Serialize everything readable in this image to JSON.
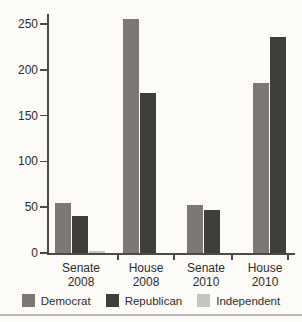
{
  "chart_data": {
    "type": "bar",
    "categories": [
      "Senate 2008",
      "House 2008",
      "Senate 2010",
      "House 2010"
    ],
    "series": [
      {
        "name": "Democrat",
        "color": "#7b7875",
        "values": [
          55,
          255,
          52,
          186
        ]
      },
      {
        "name": "Republican",
        "color": "#403e3c",
        "values": [
          40,
          175,
          47,
          236
        ]
      },
      {
        "name": "Independent",
        "color": "#c6c4c1",
        "values": [
          2,
          0,
          0,
          0
        ]
      }
    ],
    "ylim": [
      0,
      250
    ],
    "yticks": [
      0,
      50,
      100,
      150,
      200,
      250
    ],
    "grid": false,
    "legend_position": "bottom"
  },
  "colors": {
    "background": "#fcfbf8",
    "axis": "#4b4a48",
    "text": "#2e2d2b",
    "bottom_rule": "#bab8b5"
  }
}
